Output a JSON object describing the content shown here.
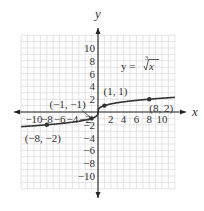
{
  "chart_data": {
    "type": "line",
    "title": "",
    "function_label": "y = ∛x",
    "function_label_parts": {
      "lhs": "y = ",
      "index": "3",
      "radicand": "x"
    },
    "xlabel": "x",
    "ylabel": "y",
    "xlim": [
      -12,
      12
    ],
    "ylim": [
      -12,
      12
    ],
    "grid": true,
    "legend_position": "none",
    "x_ticks": [
      -10,
      -8,
      -6,
      -4,
      -2,
      2,
      4,
      6,
      8,
      10
    ],
    "x_tick_labels": [
      "−10",
      "−8",
      "−6",
      "−4",
      "−2",
      "2",
      "4",
      "6",
      "8",
      "10"
    ],
    "y_ticks": [
      10,
      8,
      6,
      4,
      2,
      -2,
      -4,
      -6,
      -8,
      -10
    ],
    "y_tick_labels": [
      "10",
      "8",
      "6",
      "4",
      "2",
      "−2",
      "−4",
      "−6",
      "−8",
      "−10"
    ],
    "series": [
      {
        "name": "y = cube root of x",
        "function": "cbrt",
        "x_range": [
          -12,
          12
        ],
        "color": "#333333"
      }
    ],
    "points": [
      {
        "x": -8,
        "y": -2,
        "label": "(−8, −2)"
      },
      {
        "x": -1,
        "y": -1,
        "label": "(−1, −1)"
      },
      {
        "x": 1,
        "y": 1,
        "label": "(1, 1)"
      },
      {
        "x": 8,
        "y": 2,
        "label": "(8, 2)"
      }
    ]
  },
  "colors": {
    "grid": "#d9d9d9",
    "axis": "#222222",
    "curve": "#333333",
    "text": "#333333"
  }
}
